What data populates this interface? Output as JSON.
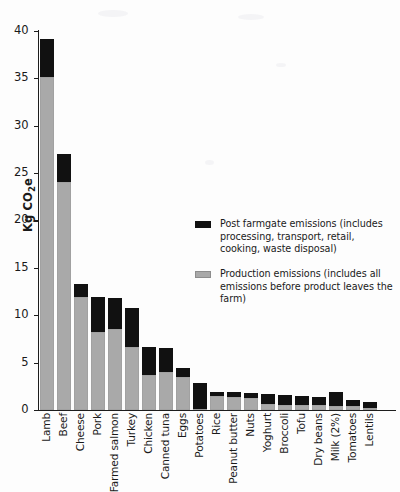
{
  "chart_data": {
    "type": "bar",
    "stacked": true,
    "title": "",
    "xlabel": "",
    "ylabel": "Kg CO2e",
    "ylabel_display": "Kg CO₂e",
    "ylim": [
      0,
      40
    ],
    "ytick_step": 5,
    "yticks": [
      0,
      5,
      10,
      15,
      20,
      25,
      30,
      35,
      40
    ],
    "ytick_labels": [
      "0",
      "5",
      "10",
      "15",
      "20",
      "25",
      "30",
      "35",
      "40"
    ],
    "grid": false,
    "legend_position": "inside-right",
    "categories": [
      "Lamb",
      "Beef",
      "Cheese",
      "Pork",
      "Farmed salmon",
      "Turkey",
      "Chicken",
      "Canned tuna",
      "Eggs",
      "Potatoes",
      "Rice",
      "Peanut butter",
      "Nuts",
      "Yoghurt",
      "Broccoli",
      "Tofu",
      "Dry beans",
      "Milk (2%)",
      "Tomatoes",
      "Lentils"
    ],
    "series": [
      {
        "name": "Production emissions",
        "color": "#a9a9a9",
        "values": [
          35.1,
          24.1,
          11.9,
          8.2,
          8.5,
          6.6,
          3.7,
          4.0,
          3.5,
          0.15,
          1.5,
          1.4,
          1.3,
          0.6,
          0.5,
          0.5,
          0.5,
          0.4,
          0.4,
          0.25
        ]
      },
      {
        "name": "Post farmgate emissions",
        "color": "#111111",
        "values": [
          4.1,
          2.9,
          1.4,
          3.7,
          3.3,
          4.2,
          3.0,
          2.5,
          0.9,
          2.75,
          0.4,
          0.5,
          0.5,
          1.1,
          1.1,
          1.0,
          0.9,
          1.5,
          0.7,
          0.6
        ]
      }
    ],
    "totals": [
      39.2,
      27.0,
      13.3,
      11.9,
      11.8,
      10.8,
      6.7,
      6.5,
      4.4,
      2.9,
      1.9,
      1.9,
      1.8,
      1.7,
      1.6,
      1.5,
      1.4,
      1.9,
      1.1,
      0.85
    ],
    "legend": [
      {
        "swatch": "#111111",
        "label": "Post farmgate emissions (includes processing, transport, retail, cooking, waste disposal)"
      },
      {
        "swatch": "#a9a9a9",
        "label": "Production emissions (includes all emissions before product leaves the farm)"
      }
    ]
  }
}
